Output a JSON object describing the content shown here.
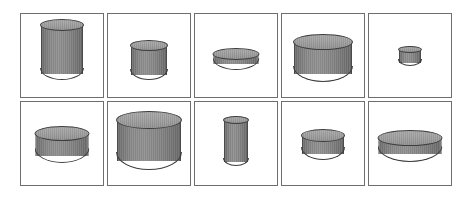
{
  "figure": {
    "background_color": "#ffffff",
    "panel_border_color": "#6e6e6e",
    "cylinder_body_color": "#808080",
    "cylinder_top_color": "#9a9a9a",
    "cylinder_outline_color": "#3d3d3d",
    "rows": 2,
    "columns": 5,
    "item_count": 10
  },
  "cells": [
    {
      "id": "cell-1",
      "row": 1,
      "column": 1,
      "shape": "cylinder",
      "width_px": 42,
      "height_px": 61,
      "ellipse_height_px": 12,
      "center_x_px": 60,
      "base_y_px": 82
    },
    {
      "id": "cell-2",
      "row": 1,
      "column": 2,
      "shape": "cylinder",
      "width_px": 36,
      "height_px": 40,
      "ellipse_height_px": 11,
      "center_x_px": 146,
      "base_y_px": 82
    },
    {
      "id": "cell-3",
      "row": 1,
      "column": 3,
      "shape": "cylinder",
      "width_px": 45,
      "height_px": 22,
      "ellipse_height_px": 12,
      "center_x_px": 232,
      "base_y_px": 72
    },
    {
      "id": "cell-4",
      "row": 1,
      "column": 4,
      "shape": "cylinder",
      "width_px": 58,
      "height_px": 48,
      "ellipse_height_px": 16,
      "center_x_px": 318,
      "base_y_px": 84
    },
    {
      "id": "cell-5",
      "row": 1,
      "column": 5,
      "shape": "cylinder",
      "width_px": 22,
      "height_px": 20,
      "ellipse_height_px": 7,
      "center_x_px": 407,
      "base_y_px": 68
    },
    {
      "id": "cell-6",
      "row": 2,
      "column": 1,
      "shape": "cylinder",
      "width_px": 53,
      "height_px": 37,
      "ellipse_height_px": 15,
      "center_x_px": 62,
      "base_y_px": 168
    },
    {
      "id": "cell-7",
      "row": 2,
      "column": 2,
      "shape": "cylinder",
      "width_px": 64,
      "height_px": 59,
      "ellipse_height_px": 18,
      "center_x_px": 147,
      "base_y_px": 175
    },
    {
      "id": "cell-8",
      "row": 2,
      "column": 3,
      "shape": "cylinder",
      "width_px": 24,
      "height_px": 50,
      "ellipse_height_px": 8,
      "center_x_px": 233,
      "base_y_px": 171
    },
    {
      "id": "cell-9",
      "row": 2,
      "column": 4,
      "shape": "cylinder",
      "width_px": 42,
      "height_px": 31,
      "ellipse_height_px": 13,
      "center_x_px": 319,
      "base_y_px": 165
    },
    {
      "id": "cell-10",
      "row": 2,
      "column": 5,
      "shape": "cylinder",
      "width_px": 63,
      "height_px": 32,
      "ellipse_height_px": 16,
      "center_x_px": 406,
      "base_y_px": 167
    }
  ]
}
